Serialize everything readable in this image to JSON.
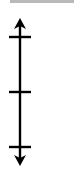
{
  "diagram": {
    "type": "vertical-double-arrow-scale",
    "colors": {
      "stroke": "#000000",
      "top_rule": "#b9b9b9",
      "background": "#ffffff"
    },
    "axis": {
      "x": 20,
      "y_top": 18,
      "y_bottom": 166,
      "arrows": [
        "up-arrow",
        "down-arrow"
      ],
      "ticks": [
        {
          "name": "top-tick",
          "y": 37
        },
        {
          "name": "middle-tick",
          "y": 92
        },
        {
          "name": "bottom-tick",
          "y": 147
        }
      ],
      "tick_half_width": 11
    }
  }
}
